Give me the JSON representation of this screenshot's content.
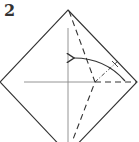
{
  "diagram": {
    "type": "origami-step",
    "step_number": "2",
    "elements": [
      {
        "name": "paper-outline",
        "shape": "diamond"
      },
      {
        "name": "center-crease-vertical",
        "style": "solid"
      },
      {
        "name": "center-crease-horizontal",
        "style": "solid"
      },
      {
        "name": "valley-fold-line",
        "style": "dashed"
      },
      {
        "name": "reference-line",
        "style": "dash-dot"
      },
      {
        "name": "fold-arrow",
        "direction": "right-to-upper-left"
      }
    ],
    "colors": {
      "line": "#333333",
      "crease": "#888888"
    }
  }
}
